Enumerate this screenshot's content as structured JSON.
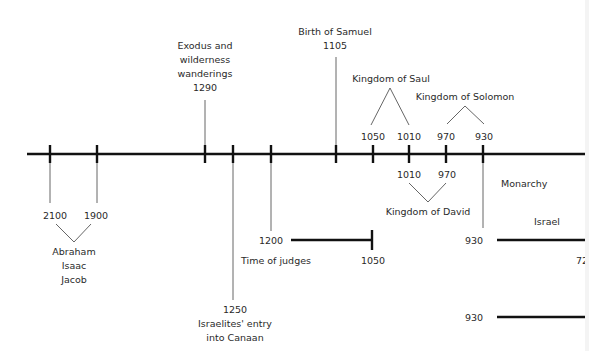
{
  "colors": {
    "line": "#111111",
    "connector": "#555555",
    "text": "#2a2a2a",
    "background": "#ffffff"
  },
  "axis": {
    "y": 154,
    "x_start": 27,
    "x_end": 589
  },
  "ticks": [
    {
      "id": "t2100",
      "x": 50
    },
    {
      "id": "t1900",
      "x": 97
    },
    {
      "id": "t1290",
      "x": 205
    },
    {
      "id": "t1250",
      "x": 233
    },
    {
      "id": "t1200",
      "x": 271
    },
    {
      "id": "t1105",
      "x": 336
    },
    {
      "id": "t1050",
      "x": 373
    },
    {
      "id": "t1010",
      "x": 409
    },
    {
      "id": "t970",
      "x": 446
    },
    {
      "id": "t930",
      "x": 483
    }
  ],
  "events": {
    "patriarchs": {
      "start_year": "2100",
      "end_year": "1900",
      "names": [
        "Abraham",
        "Isaac",
        "Jacob"
      ]
    },
    "exodus": {
      "lines": [
        "Exodus and",
        "wilderness",
        "wanderings"
      ],
      "year": "1290"
    },
    "entry": {
      "year": "1250",
      "lines": [
        "Israelites' entry",
        "into Canaan"
      ]
    },
    "judges": {
      "start_year": "1200",
      "end_year": "1050",
      "label": "Time of judges"
    },
    "samuel": {
      "label": "Birth of Samuel",
      "year": "1105"
    },
    "saul": {
      "label": "Kingdom of Saul",
      "start_year": "1050",
      "end_year": "1010"
    },
    "solomon": {
      "label": "Kingdom of Solomon",
      "start_year": "970",
      "end_year": "930"
    },
    "david": {
      "label": "Kingdom of David",
      "start_year": "1010",
      "end_year": "970"
    },
    "monarchy": {
      "label": "Monarchy",
      "israel_label": "Israel",
      "israel_start": "930",
      "israel_end_partial": "72",
      "judah_start": "930"
    }
  }
}
